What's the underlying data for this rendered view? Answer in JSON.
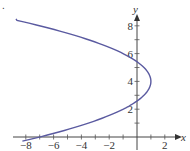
{
  "item_marker": ".",
  "chart_data": {
    "type": "line",
    "title": "",
    "xlabel": "x",
    "ylabel": "y",
    "xlim": [
      -9,
      2.5
    ],
    "ylim": [
      -0.5,
      9
    ],
    "grid": false,
    "legend": null,
    "x_ticks": [
      -8,
      -6,
      -4,
      -2,
      2
    ],
    "x_tick_labels": [
      "−8",
      "−6",
      "−4",
      "−2",
      "2"
    ],
    "x_minor_ticks": [
      -8,
      -7,
      -6,
      -5,
      -4,
      -3,
      -2,
      -1,
      1,
      2
    ],
    "y_ticks": [
      2,
      4,
      6,
      8
    ],
    "y_tick_labels": [
      "2",
      "4",
      "6",
      "8"
    ],
    "y_minor_ticks": [
      1,
      2,
      3,
      4,
      5,
      6,
      7,
      8
    ],
    "series": [
      {
        "name": "parabola x = -y²/2 + 4y - 7",
        "color": "#5a5aa0",
        "equation": "x = 1 - (y - 4)^2 / 2",
        "vertex": [
          1,
          4
        ],
        "y_range": [
          -0.3,
          8.5
        ],
        "points": [
          {
            "x": -8.8,
            "y": 8.4
          },
          {
            "x": -7,
            "y": 8
          },
          {
            "x": -3.5,
            "y": 7
          },
          {
            "x": -1,
            "y": 6
          },
          {
            "x": 0.5,
            "y": 5
          },
          {
            "x": 1,
            "y": 4
          },
          {
            "x": 0.5,
            "y": 3
          },
          {
            "x": -1,
            "y": 2
          },
          {
            "x": -3.5,
            "y": 1
          },
          {
            "x": -7,
            "y": 0
          },
          {
            "x": -8.3,
            "y": -0.3
          }
        ]
      }
    ]
  }
}
